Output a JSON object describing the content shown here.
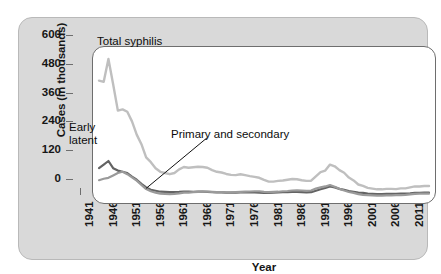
{
  "figure": {
    "x_axis_title": "Year",
    "y_axis_title": "Cases (in thousands)",
    "annotations": {
      "total_syphilis": "Total syphilis",
      "early_latent": "Early\nlatent",
      "primary_secondary": "Primary and secondary"
    },
    "colors": {
      "panel_background": "#d9d9d9",
      "panel_border": "#b9b9b9",
      "plot_background": "#ffffff",
      "axis": "#6e6e6e",
      "text": "#161616",
      "total_syphilis_line": "#bfbfbf",
      "early_latent_line": "#636363",
      "primary_secondary_line": "#9a9a9a",
      "leader_line": "#111111"
    }
  },
  "chart_data": {
    "type": "line",
    "title": "",
    "xlabel": "Year",
    "ylabel": "Cases (in thousands)",
    "xlim": [
      1941,
      2011
    ],
    "ylim": [
      0,
      600
    ],
    "yticks": [
      0,
      120,
      240,
      360,
      480,
      600
    ],
    "ytick_labels": [
      "0",
      "120",
      "240",
      "360",
      "480",
      "600"
    ],
    "xticks": [
      1941,
      1946,
      1951,
      1956,
      1961,
      1966,
      1971,
      1976,
      1981,
      1986,
      1991,
      1996,
      2001,
      2006,
      2011
    ],
    "xtick_labels": [
      "1941",
      "1946",
      "1951",
      "1956",
      "1961",
      "1966",
      "1971",
      "1976",
      "1981",
      "1986",
      "1991",
      "1996",
      "2001",
      "2006",
      "2011"
    ],
    "grid": false,
    "legend": "none (inline annotations)",
    "x": [
      1941,
      1942,
      1943,
      1944,
      1945,
      1946,
      1947,
      1948,
      1949,
      1950,
      1951,
      1952,
      1953,
      1954,
      1955,
      1956,
      1957,
      1958,
      1959,
      1960,
      1961,
      1962,
      1963,
      1964,
      1965,
      1966,
      1967,
      1968,
      1969,
      1970,
      1971,
      1972,
      1973,
      1974,
      1975,
      1976,
      1977,
      1978,
      1979,
      1980,
      1981,
      1982,
      1983,
      1984,
      1985,
      1986,
      1987,
      1988,
      1989,
      1990,
      1991,
      1992,
      1993,
      1994,
      1995,
      1996,
      1997,
      1998,
      1999,
      2000,
      2001,
      2002,
      2003,
      2004,
      2005,
      2006,
      2007,
      2008,
      2009,
      2010,
      2011
    ],
    "series": [
      {
        "name": "Total syphilis",
        "color": "#bfbfbf",
        "values": [
          485,
          480,
          575,
          470,
          360,
          365,
          355,
          315,
          260,
          220,
          165,
          145,
          120,
          105,
          100,
          95,
          100,
          115,
          125,
          122,
          124,
          126,
          125,
          122,
          112,
          105,
          102,
          96,
          92,
          91,
          95,
          91,
          87,
          84,
          80,
          71,
          64,
          64,
          67,
          69,
          72,
          75,
          74,
          70,
          67,
          68,
          86,
          104,
          110,
          135,
          128,
          112,
          101,
          81,
          69,
          52,
          46,
          38,
          35,
          32,
          32,
          34,
          34,
          33,
          36,
          36,
          40,
          44,
          44,
          46,
          46
        ]
      },
      {
        "name": "Early latent",
        "color": "#636363",
        "values": [
          120,
          135,
          150,
          120,
          110,
          105,
          100,
          85,
          72,
          55,
          40,
          30,
          26,
          22,
          21,
          20,
          20,
          21,
          23,
          22,
          21,
          22,
          22,
          21,
          20,
          19,
          19,
          18,
          18,
          18,
          19,
          19,
          19,
          19,
          18,
          17,
          17,
          18,
          19,
          20,
          20,
          21,
          21,
          20,
          19,
          20,
          26,
          32,
          38,
          44,
          40,
          34,
          30,
          25,
          22,
          18,
          17,
          14,
          13,
          12,
          12,
          13,
          13,
          13,
          14,
          14,
          15,
          17,
          17,
          18,
          18
        ]
      },
      {
        "name": "Primary and secondary",
        "color": "#9a9a9a",
        "values": [
          70,
          76,
          80,
          90,
          100,
          105,
          95,
          82,
          68,
          50,
          33,
          24,
          18,
          14,
          13,
          12,
          13,
          15,
          18,
          18,
          20,
          21,
          22,
          22,
          21,
          20,
          20,
          19,
          19,
          20,
          21,
          22,
          23,
          24,
          24,
          21,
          20,
          21,
          22,
          24,
          25,
          27,
          28,
          27,
          26,
          27,
          35,
          40,
          44,
          50,
          43,
          34,
          27,
          21,
          17,
          12,
          9,
          8,
          7,
          6,
          6,
          7,
          7,
          8,
          8,
          9,
          11,
          13,
          14,
          14,
          14
        ]
      }
    ]
  }
}
